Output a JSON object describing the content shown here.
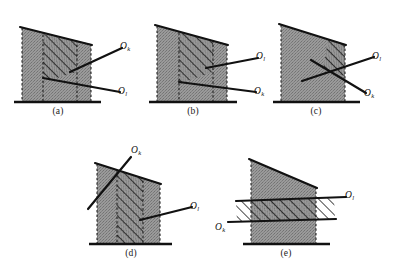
{
  "figure": {
    "type": "geometric-diagram",
    "background_color": "#ffffff",
    "fill_color": "#8f8f8f",
    "line_color": "#111111",
    "hatch_color": "#111111",
    "panels": [
      {
        "id": "a",
        "caption": "(a)",
        "labels": [
          {
            "name": "O_k",
            "base": "O",
            "sub": "k"
          },
          {
            "name": "O_l",
            "base": "O",
            "sub": "l"
          }
        ],
        "upper_line_label": "O_k",
        "lower_line_label": "O_l",
        "hatch_direction": "up-right",
        "note": "Both lines enter from the right; hatched band lies between them inside the shape."
      },
      {
        "id": "b",
        "caption": "(b)",
        "labels": [
          {
            "name": "O_l",
            "base": "O",
            "sub": "l"
          },
          {
            "name": "O_k",
            "base": "O",
            "sub": "k"
          }
        ],
        "upper_line_label": "O_l",
        "lower_line_label": "O_k",
        "hatch_direction": "up-right",
        "note": "Same geometry as (a) but the line labels are interchanged."
      },
      {
        "id": "c",
        "caption": "(c)",
        "labels": [
          {
            "name": "O_l",
            "base": "O",
            "sub": "l"
          },
          {
            "name": "O_k",
            "base": "O",
            "sub": "k"
          }
        ],
        "upper_line_label": "O_l",
        "lower_line_label": "O_k",
        "hatch_direction": "up-right",
        "note": "The two lines cross inside the shape; only a small triangle at the upper right is hatched."
      },
      {
        "id": "d",
        "caption": "(d)",
        "labels": [
          {
            "name": "O_k",
            "base": "O",
            "sub": "k"
          },
          {
            "name": "O_l",
            "base": "O",
            "sub": "l"
          }
        ],
        "upper_line_label": "O_k",
        "lower_line_label": "O_l",
        "hatch_direction": "up-right",
        "note": "O_k is a steep line crossing the upper left; O_l enters flat from the right."
      },
      {
        "id": "e",
        "caption": "(e)",
        "labels": [
          {
            "name": "O_l",
            "base": "O",
            "sub": "l"
          },
          {
            "name": "O_k",
            "base": "O",
            "sub": "k"
          }
        ],
        "upper_line_label": "O_l",
        "lower_line_label": "O_k",
        "hatch_direction": "up-right",
        "note": "Two nearly horizontal parallel lines form a hatched horizontal band wider than the shaded column."
      }
    ]
  }
}
